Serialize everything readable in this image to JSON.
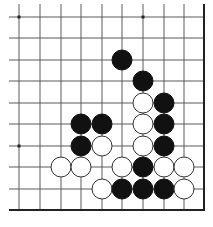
{
  "diagram": {
    "type": "go-board-fragment",
    "colors": {
      "line": "#5a5a5a",
      "edge": "#222222",
      "black": "#111111",
      "white": "#ffffff",
      "stone_outline": "#333333"
    },
    "grid": {
      "x": [
        19,
        40,
        61,
        81,
        102,
        122,
        143,
        164,
        184
      ],
      "y": [
        17,
        38,
        60,
        81,
        103,
        124,
        146,
        167,
        189
      ],
      "right_edge_x": 204,
      "bottom_edge_y": 210,
      "left_extent_x": 9,
      "top_extent_y": 4
    },
    "star_points": [
      [
        0,
        0
      ],
      [
        6,
        0
      ],
      [
        0,
        6
      ]
    ],
    "stones": [
      {
        "color": "black",
        "col": 5,
        "row": 2
      },
      {
        "color": "black",
        "col": 6,
        "row": 3
      },
      {
        "color": "white",
        "col": 6,
        "row": 4
      },
      {
        "color": "black",
        "col": 7,
        "row": 4
      },
      {
        "color": "black",
        "col": 3,
        "row": 5
      },
      {
        "color": "black",
        "col": 4,
        "row": 5
      },
      {
        "color": "white",
        "col": 6,
        "row": 5
      },
      {
        "color": "black",
        "col": 7,
        "row": 5
      },
      {
        "color": "black",
        "col": 3,
        "row": 6
      },
      {
        "color": "white",
        "col": 4,
        "row": 6
      },
      {
        "color": "white",
        "col": 6,
        "row": 6
      },
      {
        "color": "black",
        "col": 7,
        "row": 6
      },
      {
        "color": "white",
        "col": 2,
        "row": 7
      },
      {
        "color": "white",
        "col": 3,
        "row": 7
      },
      {
        "color": "white",
        "col": 5,
        "row": 7
      },
      {
        "color": "black",
        "col": 6,
        "row": 7
      },
      {
        "color": "white",
        "col": 7,
        "row": 7
      },
      {
        "color": "white",
        "col": 8,
        "row": 7
      },
      {
        "color": "white",
        "col": 4,
        "row": 8
      },
      {
        "color": "black",
        "col": 5,
        "row": 8
      },
      {
        "color": "black",
        "col": 6,
        "row": 8
      },
      {
        "color": "black",
        "col": 7,
        "row": 8
      },
      {
        "color": "white",
        "col": 8,
        "row": 8
      }
    ]
  }
}
